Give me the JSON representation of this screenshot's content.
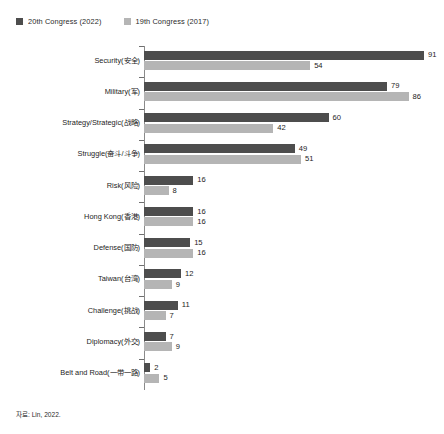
{
  "legend": {
    "entries": [
      {
        "label": "20th Congress (2022)",
        "color": "#4d4d4d",
        "swatch_icon": "square-swatch-icon"
      },
      {
        "label": "19th Congress (2017)",
        "color": "#b5b5b5",
        "swatch_icon": "square-swatch-icon"
      }
    ]
  },
  "source": {
    "text": "자료: Lin, 2022."
  },
  "chart_data": {
    "type": "bar",
    "orientation": "horizontal",
    "title": "",
    "subtitle": "",
    "xlabel": "",
    "ylabel": "",
    "xlim": [
      0,
      91
    ],
    "grid": false,
    "legend_position": "top-left",
    "categories": [
      "Security(安全)",
      "Military(军)",
      "Strategy/Strategic(战略)",
      "Struggle(奋斗/斗争)",
      "Risk(风险)",
      "Hong Kong(香港)",
      "Defense(国防)",
      "Taiwan(台湾)",
      "Challenge(挑战)",
      "Diplomacy(外交)",
      "Belt and Road(一带一路)"
    ],
    "series": [
      {
        "name": "20th Congress (2022)",
        "color": "#4d4d4d",
        "values": [
          91,
          79,
          60,
          49,
          16,
          16,
          15,
          12,
          11,
          7,
          2
        ]
      },
      {
        "name": "19th Congress (2017)",
        "color": "#b5b5b5",
        "values": [
          54,
          86,
          42,
          51,
          8,
          16,
          16,
          9,
          7,
          9,
          5
        ]
      }
    ]
  }
}
